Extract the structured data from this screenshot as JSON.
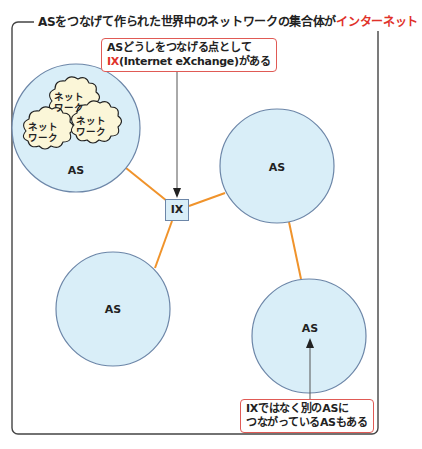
{
  "title": {
    "prefix": "ASをつなげて作られた世界中のネットワークの集合体が",
    "highlight": "インターネット"
  },
  "callout_ix": {
    "line1": "ASどうしをつなげる点として",
    "line2_highlight": "IX",
    "line2_rest": "(Internet eXchange)がある"
  },
  "callout_as": {
    "line1": "IXではなく別のASに",
    "line2": "つながっているASもある"
  },
  "ix": {
    "label": "IX"
  },
  "as_nodes": [
    {
      "id": "as-top-left",
      "label": "AS"
    },
    {
      "id": "as-right",
      "label": "AS"
    },
    {
      "id": "as-bottom-left",
      "label": "AS"
    },
    {
      "id": "as-bottom-right",
      "label": "AS"
    }
  ],
  "networks": [
    {
      "line1": "ネット",
      "line2": "ワーク"
    },
    {
      "line1": "ネット",
      "line2": "ワーク"
    },
    {
      "line1": "ネット",
      "line2": "ワーク"
    }
  ],
  "colors": {
    "as_fill": "#d9eef8",
    "as_stroke": "#6c86a8",
    "link": "#f0932b",
    "highlight": "#e0322a",
    "callout_border": "#e05a55",
    "cloud_fill": "#fbf6d8",
    "frame": "#444444"
  }
}
